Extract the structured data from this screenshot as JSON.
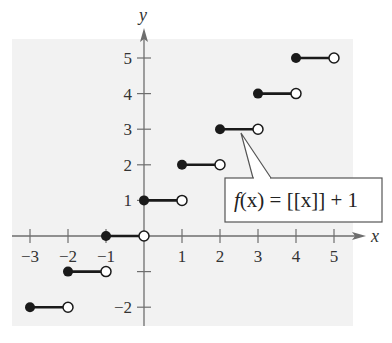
{
  "chart_data": {
    "type": "line",
    "title": "",
    "xlabel": "x",
    "ylabel": "y",
    "xlim": [
      -3.3,
      5.7
    ],
    "ylim": [
      -2.5,
      5.5
    ],
    "grid": false,
    "x_ticks": [
      -3,
      -2,
      -1,
      1,
      2,
      3,
      4,
      5
    ],
    "x_tick_labels": [
      "−3",
      "−2",
      "−1",
      "1",
      "2",
      "3",
      "4",
      "5"
    ],
    "y_ticks": [
      -2,
      -1,
      1,
      2,
      3,
      4,
      5
    ],
    "y_tick_labels": [
      "−2",
      "",
      "1",
      "2",
      "3",
      "4",
      "5"
    ],
    "annotation": "f(x) = [[x]] + 1",
    "series": [
      {
        "name": "f(x) = [[x]] + 1",
        "style": "step (greatest integer), closed dot at left endpoint, open dot at right endpoint",
        "segments": [
          {
            "x_start": -3,
            "x_end": -2,
            "y": -2
          },
          {
            "x_start": -2,
            "x_end": -1,
            "y": -1
          },
          {
            "x_start": -1,
            "x_end": 0,
            "y": 0
          },
          {
            "x_start": 0,
            "x_end": 1,
            "y": 1
          },
          {
            "x_start": 1,
            "x_end": 2,
            "y": 2
          },
          {
            "x_start": 2,
            "x_end": 3,
            "y": 3
          },
          {
            "x_start": 3,
            "x_end": 4,
            "y": 4
          },
          {
            "x_start": 4,
            "x_end": 5,
            "y": 5
          }
        ]
      }
    ]
  },
  "labels": {
    "x_axis": "x",
    "y_axis": "y",
    "callout": {
      "f": "f",
      "rest": "(x) = [[x]] + 1"
    }
  },
  "colors": {
    "panel": "#f2f2f2",
    "axis": "#6e6e6e",
    "segment": "#1a1a1a",
    "callout_border": "#555555"
  }
}
